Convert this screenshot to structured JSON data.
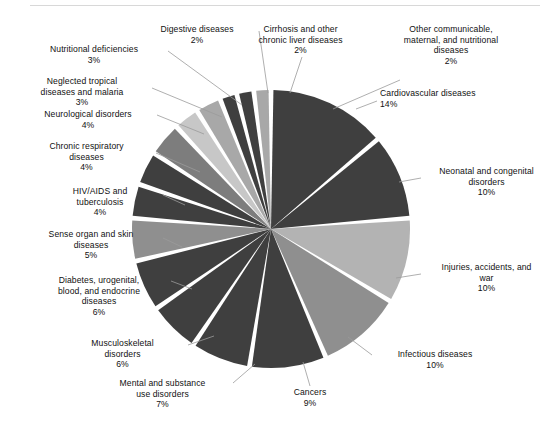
{
  "figure": {
    "background_color": "#ffffff",
    "rule_color": "#d8d8d8"
  },
  "chart_data": {
    "type": "pie",
    "title": "",
    "subtitle": "",
    "xlabel": "",
    "ylabel": "",
    "legend_position": "none-callout-labels",
    "grid": false,
    "value_unit": "percent",
    "start_angle_deg": 0,
    "direction": "clockwise",
    "categories": [
      "Cardiovascular diseases",
      "Neonatal and congenital disorders",
      "Injuries, accidents, and war",
      "Infectious diseases",
      "Cancers",
      "Mental and substance use disorders",
      "Musculoskeletal disorders",
      "Diabetes, urogenital, blood, and endocrine diseases",
      "Sense organ and skin diseases",
      "HIV/AIDS and tuberculosis",
      "Chronic respiratory diseases",
      "Neurological disorders",
      "Neglected tropical diseases and malaria",
      "Nutritional deficiencies",
      "Digestive diseases",
      "Cirrhosis and other chronic liver diseases",
      "Other communicable, maternal, and nutritional diseases"
    ],
    "values": [
      14,
      10,
      10,
      10,
      9,
      7,
      6,
      6,
      5,
      4,
      4,
      4,
      3,
      3,
      2,
      2,
      2
    ],
    "colors": [
      "#3f3f3f",
      "#3f3f3f",
      "#b3b3b3",
      "#8f8f8f",
      "#3f3f3f",
      "#3f3f3f",
      "#3f3f3f",
      "#3f3f3f",
      "#8f8f8f",
      "#3f3f3f",
      "#3f3f3f",
      "#7d7d7d",
      "#c7c7c7",
      "#a8a8a8",
      "#3f3f3f",
      "#3f3f3f",
      "#a8a8a8"
    ],
    "slices": [
      {
        "label": "Cardiovascular diseases",
        "pct_text": "14%",
        "value": 14,
        "color": "#3f3f3f"
      },
      {
        "label": "Neonatal and congenital disorders",
        "pct_text": "10%",
        "value": 10,
        "color": "#3f3f3f"
      },
      {
        "label": "Injuries, accidents, and war",
        "pct_text": "10%",
        "value": 10,
        "color": "#b3b3b3"
      },
      {
        "label": "Infectious diseases",
        "pct_text": "10%",
        "value": 10,
        "color": "#8f8f8f"
      },
      {
        "label": "Cancers",
        "pct_text": "9%",
        "value": 9,
        "color": "#3f3f3f"
      },
      {
        "label": "Mental and substance use disorders",
        "pct_text": "7%",
        "value": 7,
        "color": "#3f3f3f"
      },
      {
        "label": "Musculoskeletal disorders",
        "pct_text": "6%",
        "value": 6,
        "color": "#3f3f3f"
      },
      {
        "label": "Diabetes, urogenital, blood, and endocrine diseases",
        "pct_text": "6%",
        "value": 6,
        "color": "#3f3f3f"
      },
      {
        "label": "Sense organ and skin diseases",
        "pct_text": "5%",
        "value": 5,
        "color": "#8f8f8f"
      },
      {
        "label": "HIV/AIDS and tuberculosis",
        "pct_text": "4%",
        "value": 4,
        "color": "#3f3f3f"
      },
      {
        "label": "Chronic respiratory diseases",
        "pct_text": "4%",
        "value": 4,
        "color": "#3f3f3f"
      },
      {
        "label": "Neurological disorders",
        "pct_text": "4%",
        "value": 4,
        "color": "#7d7d7d"
      },
      {
        "label": "Neglected tropical diseases and malaria",
        "pct_text": "3%",
        "value": 3,
        "color": "#c7c7c7"
      },
      {
        "label": "Nutritional deficiencies",
        "pct_text": "3%",
        "value": 3,
        "color": "#a8a8a8"
      },
      {
        "label": "Digestive diseases",
        "pct_text": "2%",
        "value": 2,
        "color": "#3f3f3f"
      },
      {
        "label": "Cirrhosis and other chronic liver diseases",
        "pct_text": "2%",
        "value": 2,
        "color": "#3f3f3f"
      },
      {
        "label": "Other communicable, maternal, and nutritional diseases",
        "pct_text": "2%",
        "value": 2,
        "color": "#a8a8a8"
      }
    ]
  },
  "geometry": {
    "center_x": 271,
    "center_y": 229,
    "radius": 139,
    "gap_deg": 2.0,
    "separator_color": "#ffffff"
  },
  "callouts": [
    {
      "name": "cardiovascular-diseases",
      "text": "Cardiovascular diseases",
      "pct": "14%",
      "x": 380,
      "y": 88,
      "w": 165,
      "align": "lbl-left-start",
      "leader": [
        [
          377,
          101
        ],
        [
          356,
          109
        ]
      ]
    },
    {
      "name": "neonatal-and-congenital-disorders",
      "text": "Neonatal and congenital\ndisorders",
      "pct": "10%",
      "x": 424,
      "y": 166,
      "w": 125,
      "align": "lbl-center",
      "leader": [
        [
          421,
          178
        ],
        [
          399,
          182
        ]
      ]
    },
    {
      "name": "injuries-accidents-and-war",
      "text": "Injuries, accidents, and\nwar",
      "pct": "10%",
      "x": 424,
      "y": 262,
      "w": 125,
      "align": "lbl-center",
      "leader": [
        [
          421,
          274
        ],
        [
          396,
          278
        ]
      ]
    },
    {
      "name": "infectious-diseases",
      "text": "Infectious diseases",
      "pct": "10%",
      "x": 375,
      "y": 349,
      "w": 120,
      "align": "lbl-center",
      "leader": [
        [
          372,
          355
        ],
        [
          348,
          337
        ]
      ]
    },
    {
      "name": "cancers",
      "text": "Cancers",
      "pct": "9%",
      "x": 265,
      "y": 387,
      "w": 90,
      "align": "lbl-center",
      "leader": [
        [
          310,
          386
        ],
        [
          303,
          362
        ]
      ]
    },
    {
      "name": "mental-and-substance-use-disorders",
      "text": "Mental and substance\nuse disorders",
      "pct": "7%",
      "x": 95,
      "y": 378,
      "w": 135,
      "align": "lbl-center",
      "leader": [
        [
          233,
          383
        ],
        [
          255,
          364
        ]
      ]
    },
    {
      "name": "musculoskeletal-disorders",
      "text": "Musculoskeletal\ndisorders",
      "pct": "6%",
      "x": 60,
      "y": 338,
      "w": 125,
      "align": "lbl-center",
      "leader": [
        [
          188,
          345
        ],
        [
          214,
          336
        ]
      ]
    },
    {
      "name": "diabetes-urogenital-blood-and-endocrine-diseases",
      "text": "Diabetes, urogenital,\nblood, and endocrine\ndiseases",
      "pct": "6%",
      "x": 30,
      "y": 275,
      "w": 138,
      "align": "lbl-center",
      "leader": [
        [
          171,
          281
        ],
        [
          192,
          289
        ]
      ]
    },
    {
      "name": "sense-organ-and-skin-diseases",
      "text": "Sense organ and skin\ndiseases",
      "pct": "5%",
      "x": 22,
      "y": 229,
      "w": 138,
      "align": "lbl-center",
      "leader": [
        [
          163,
          238
        ],
        [
          182,
          247
        ]
      ]
    },
    {
      "name": "hiv-aids-and-tuberculosis",
      "text": "HIV/AIDS and\ntuberculosis",
      "pct": "4%",
      "x": 40,
      "y": 186,
      "w": 120,
      "align": "lbl-center",
      "leader": [
        [
          163,
          195
        ],
        [
          185,
          205
        ]
      ]
    },
    {
      "name": "chronic-respiratory-diseases",
      "text": "Chronic respiratory\ndiseases",
      "pct": "4%",
      "x": 20,
      "y": 141,
      "w": 133,
      "align": "lbl-center",
      "leader": [
        [
          156,
          153
        ],
        [
          200,
          172
        ]
      ]
    },
    {
      "name": "neurological-disorders",
      "text": "Neurological disorders",
      "pct": "4%",
      "x": 22,
      "y": 109,
      "w": 132,
      "align": "lbl-center",
      "leader": [
        [
          157,
          115
        ],
        [
          204,
          134
        ]
      ]
    },
    {
      "name": "neglected-tropical-diseases-and-malaria",
      "text": "Neglected tropical\ndiseases and malaria",
      "pct": "3%",
      "x": 16,
      "y": 76,
      "w": 132,
      "align": "lbl-center",
      "leader": [
        [
          152,
          88
        ],
        [
          222,
          117
        ]
      ]
    },
    {
      "name": "nutritional-deficiencies",
      "text": "Nutritional deficiencies",
      "pct": "3%",
      "x": 24,
      "y": 44,
      "w": 140,
      "align": "lbl-center",
      "leader": [
        [
          168,
          51
        ],
        [
          242,
          105
        ]
      ]
    },
    {
      "name": "digestive-diseases",
      "text": "Digestive diseases",
      "pct": "2%",
      "x": 137,
      "y": 24,
      "w": 120,
      "align": "lbl-center",
      "leader": [
        [
          259,
          31
        ],
        [
          268,
          93
        ]
      ]
    },
    {
      "name": "cirrhosis-and-other-chronic-liver-diseases",
      "text": "Cirrhosis and other\nchronic liver diseases",
      "pct": "2%",
      "x": 233,
      "y": 24,
      "w": 135,
      "align": "lbl-center",
      "leader": [
        [
          302,
          57
        ],
        [
          290,
          93
        ]
      ]
    },
    {
      "name": "other-communicable-maternal-and-nutritional-diseases",
      "text": "Other communicable,\nmaternal, and nutritional\ndiseases",
      "pct": "2%",
      "x": 376,
      "y": 24,
      "w": 150,
      "align": "lbl-center",
      "leader": [
        [
          400,
          80
        ],
        [
          333,
          109
        ]
      ]
    }
  ]
}
